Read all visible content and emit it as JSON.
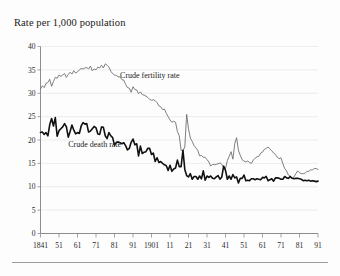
{
  "chart_data": {
    "type": "line",
    "title": "Rate per 1,000 population",
    "xlabel": "",
    "ylabel": "Rate per 1,000 population",
    "xlim": [
      1841,
      1991
    ],
    "ylim": [
      0,
      40
    ],
    "ytick_values": [
      0,
      5,
      10,
      15,
      20,
      25,
      30,
      35,
      40
    ],
    "ytick_labels": [
      "0",
      "5",
      "10",
      "15",
      "20",
      "25",
      "30",
      "35",
      "40"
    ],
    "xtick_values": [
      1841,
      1851,
      1861,
      1871,
      1881,
      1891,
      1901,
      1911,
      1921,
      1931,
      1941,
      1951,
      1961,
      1971,
      1981,
      1991
    ],
    "xtick_labels": [
      "1841",
      "51",
      "61",
      "71",
      "81",
      "91",
      "1901",
      "11",
      "21",
      "31",
      "41",
      "51",
      "61",
      "71",
      "81",
      "91"
    ],
    "grid": true,
    "grid_axis": "y",
    "legend_position": "inline-annotation",
    "colors": {
      "fertility": "#6f6f6f",
      "death": "#111111",
      "gridline": "#e9e9e9",
      "axis": "#8d8d8d",
      "text": "#1a1a1a",
      "background": "#fdfdfd"
    },
    "annotations": [
      {
        "name": "fertility-label",
        "text": "Crude fertility rate",
        "x": 1884,
        "y": 33.2
      },
      {
        "name": "death-label",
        "text": "Crude death rate",
        "x": 1856,
        "y": 18.4
      }
    ],
    "series": [
      {
        "name": "Crude fertility rate",
        "label": "Crude fertility rate",
        "color": "#6f6f6f",
        "x": [
          1841,
          1842,
          1843,
          1844,
          1845,
          1846,
          1847,
          1848,
          1849,
          1850,
          1851,
          1852,
          1853,
          1854,
          1855,
          1856,
          1857,
          1858,
          1859,
          1860,
          1861,
          1862,
          1863,
          1864,
          1865,
          1866,
          1867,
          1868,
          1869,
          1870,
          1871,
          1872,
          1873,
          1874,
          1875,
          1876,
          1877,
          1878,
          1879,
          1880,
          1881,
          1882,
          1883,
          1884,
          1885,
          1886,
          1887,
          1888,
          1889,
          1890,
          1891,
          1892,
          1893,
          1894,
          1895,
          1896,
          1897,
          1898,
          1899,
          1900,
          1901,
          1902,
          1903,
          1904,
          1905,
          1906,
          1907,
          1908,
          1909,
          1910,
          1911,
          1912,
          1913,
          1914,
          1915,
          1916,
          1917,
          1918,
          1919,
          1920,
          1921,
          1922,
          1923,
          1924,
          1925,
          1926,
          1927,
          1928,
          1929,
          1930,
          1931,
          1932,
          1933,
          1934,
          1935,
          1936,
          1937,
          1938,
          1939,
          1940,
          1941,
          1942,
          1943,
          1944,
          1945,
          1946,
          1947,
          1948,
          1949,
          1950,
          1951,
          1952,
          1953,
          1954,
          1955,
          1956,
          1957,
          1958,
          1959,
          1960,
          1961,
          1962,
          1963,
          1964,
          1965,
          1966,
          1967,
          1968,
          1969,
          1970,
          1971,
          1972,
          1973,
          1974,
          1975,
          1976,
          1977,
          1978,
          1979,
          1980,
          1981,
          1982,
          1983,
          1984,
          1985,
          1986,
          1987,
          1988,
          1989,
          1990,
          1991
        ],
        "values": [
          30.9,
          31.6,
          31.2,
          32.1,
          32.3,
          33.0,
          31.5,
          32.5,
          33.4,
          33.2,
          33.9,
          33.6,
          33.9,
          34.2,
          33.4,
          34.0,
          34.5,
          34.1,
          34.8,
          34.3,
          34.6,
          35.0,
          35.3,
          35.2,
          35.4,
          35.5,
          35.2,
          35.8,
          34.8,
          35.2,
          35.0,
          35.6,
          35.4,
          36.0,
          35.4,
          36.3,
          36.0,
          35.6,
          34.7,
          34.2,
          33.9,
          33.8,
          33.5,
          33.5,
          32.9,
          32.8,
          31.9,
          31.2,
          31.1,
          30.2,
          31.4,
          30.8,
          30.7,
          29.9,
          30.3,
          29.7,
          29.6,
          29.4,
          29.1,
          28.7,
          28.5,
          28.6,
          28.4,
          28.0,
          27.3,
          27.1,
          26.5,
          26.6,
          25.7,
          25.0,
          24.3,
          23.8,
          24.0,
          23.8,
          21.8,
          20.9,
          17.8,
          17.7,
          18.5,
          25.5,
          22.4,
          20.4,
          19.7,
          18.8,
          18.3,
          17.8,
          16.6,
          16.7,
          16.3,
          16.3,
          15.8,
          15.3,
          14.4,
          14.8,
          14.7,
          14.8,
          14.9,
          15.1,
          14.8,
          14.1,
          13.9,
          15.6,
          16.5,
          17.5,
          15.9,
          19.2,
          20.5,
          17.8,
          16.7,
          15.8,
          15.5,
          15.3,
          15.5,
          15.2,
          15.0,
          15.7,
          16.1,
          16.4,
          16.5,
          17.2,
          17.4,
          18.0,
          18.2,
          18.5,
          18.1,
          17.7,
          17.2,
          16.9,
          16.3,
          16.0,
          16.2,
          14.9,
          13.9,
          13.4,
          12.5,
          12.2,
          11.8,
          12.1,
          12.8,
          13.4,
          13.0,
          12.8,
          12.8,
          12.9,
          13.3,
          13.3,
          13.6,
          13.6,
          13.9,
          13.9,
          13.7
        ]
      },
      {
        "name": "Crude death rate",
        "label": "Crude death rate",
        "color": "#111111",
        "x": [
          1841,
          1842,
          1843,
          1844,
          1845,
          1846,
          1847,
          1848,
          1849,
          1850,
          1851,
          1852,
          1853,
          1854,
          1855,
          1856,
          1857,
          1858,
          1859,
          1860,
          1861,
          1862,
          1863,
          1864,
          1865,
          1866,
          1867,
          1868,
          1869,
          1870,
          1871,
          1872,
          1873,
          1874,
          1875,
          1876,
          1877,
          1878,
          1879,
          1880,
          1881,
          1882,
          1883,
          1884,
          1885,
          1886,
          1887,
          1888,
          1889,
          1890,
          1891,
          1892,
          1893,
          1894,
          1895,
          1896,
          1897,
          1898,
          1899,
          1900,
          1901,
          1902,
          1903,
          1904,
          1905,
          1906,
          1907,
          1908,
          1909,
          1910,
          1911,
          1912,
          1913,
          1914,
          1915,
          1916,
          1917,
          1918,
          1919,
          1920,
          1921,
          1922,
          1923,
          1924,
          1925,
          1926,
          1927,
          1928,
          1929,
          1930,
          1931,
          1932,
          1933,
          1934,
          1935,
          1936,
          1937,
          1938,
          1939,
          1940,
          1941,
          1942,
          1943,
          1944,
          1945,
          1946,
          1947,
          1948,
          1949,
          1950,
          1951,
          1952,
          1953,
          1954,
          1955,
          1956,
          1957,
          1958,
          1959,
          1960,
          1961,
          1962,
          1963,
          1964,
          1965,
          1966,
          1967,
          1968,
          1969,
          1970,
          1971,
          1972,
          1973,
          1974,
          1975,
          1976,
          1977,
          1978,
          1979,
          1980,
          1981,
          1982,
          1983,
          1984,
          1985,
          1986,
          1987,
          1988,
          1989,
          1990,
          1991
        ],
        "values": [
          21.6,
          21.7,
          21.2,
          21.6,
          20.9,
          23.3,
          24.6,
          23.0,
          24.8,
          20.8,
          22.0,
          22.4,
          22.8,
          23.5,
          22.8,
          20.6,
          21.8,
          23.2,
          22.1,
          21.3,
          21.6,
          21.4,
          23.0,
          23.7,
          23.4,
          23.5,
          21.7,
          21.9,
          22.4,
          22.9,
          22.6,
          21.3,
          21.2,
          22.8,
          22.7,
          20.9,
          20.3,
          21.6,
          20.9,
          20.5,
          18.9,
          19.5,
          19.6,
          19.4,
          19.2,
          19.4,
          18.8,
          17.9,
          18.2,
          19.5,
          20.2,
          19.0,
          19.2,
          16.6,
          18.7,
          17.1,
          17.4,
          17.5,
          18.2,
          18.2,
          16.9,
          17.2,
          15.4,
          16.2,
          15.2,
          15.4,
          15.0,
          14.7,
          14.5,
          13.5,
          14.6,
          13.3,
          13.8,
          14.0,
          15.7,
          14.3,
          14.3,
          17.8,
          13.7,
          12.4,
          12.1,
          12.8,
          11.6,
          12.2,
          12.2,
          11.6,
          12.3,
          11.7,
          13.4,
          11.4,
          12.3,
          12.0,
          12.3,
          11.8,
          11.7,
          12.1,
          12.4,
          11.6,
          12.1,
          14.4,
          13.5,
          11.6,
          12.3,
          11.6,
          12.6,
          11.9,
          12.1,
          10.8,
          11.8,
          11.8,
          12.5,
          11.3,
          11.4,
          11.3,
          11.7,
          11.7,
          11.5,
          11.7,
          11.6,
          11.5,
          12.0,
          11.9,
          12.2,
          11.3,
          11.5,
          11.7,
          11.2,
          11.9,
          11.9,
          11.8,
          11.6,
          11.6,
          12.2,
          11.9,
          11.8,
          12.2,
          11.8,
          11.7,
          11.8,
          11.8,
          11.7,
          11.6,
          11.3,
          11.4,
          11.3,
          11.4,
          11.2,
          11.3,
          11.2,
          11.1,
          11.2
        ]
      }
    ]
  }
}
